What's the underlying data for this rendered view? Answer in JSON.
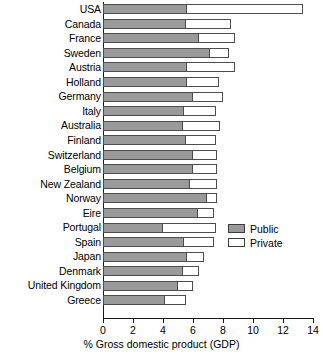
{
  "chart_data": {
    "type": "bar",
    "orientation": "horizontal",
    "stacked": true,
    "title": "",
    "xlabel": "% Gross domestic product (GDP)",
    "ylabel": "",
    "xlim": [
      0,
      14
    ],
    "xticks": [
      0,
      2,
      4,
      6,
      8,
      10,
      12,
      14
    ],
    "xtick_labels": [
      "0",
      "2",
      "4",
      "6",
      "8",
      "10",
      "12",
      "14"
    ],
    "grid": false,
    "legend_position": "right",
    "categories": [
      "USA",
      "Canada",
      "France",
      "Sweden",
      "Austria",
      "Holland",
      "Germany",
      "Italy",
      "Australia",
      "Finland",
      "Switzerland",
      "Belgium",
      "New Zealand",
      "Norway",
      "Eire",
      "Portugal",
      "Spain",
      "Japan",
      "Denmark",
      "United Kingdom",
      "Greece"
    ],
    "series": [
      {
        "name": "Public",
        "color": "#9a9a9a",
        "values": [
          5.6,
          5.5,
          6.4,
          7.1,
          5.6,
          5.6,
          6.0,
          5.4,
          5.3,
          5.5,
          6.0,
          6.0,
          5.8,
          6.9,
          6.3,
          4.0,
          5.4,
          5.6,
          5.3,
          5.0,
          4.1
        ]
      },
      {
        "name": "Private",
        "color": "#ffffff",
        "values": [
          7.7,
          3.0,
          2.4,
          1.3,
          3.2,
          2.1,
          2.0,
          2.1,
          2.5,
          2.0,
          1.6,
          1.6,
          1.8,
          0.7,
          1.1,
          3.5,
          2.0,
          1.1,
          1.1,
          1.0,
          1.4
        ]
      }
    ],
    "totals": [
      13.3,
      8.5,
      8.8,
      8.4,
      8.8,
      7.7,
      8.0,
      7.5,
      7.8,
      7.5,
      7.6,
      7.6,
      7.6,
      7.6,
      7.4,
      7.5,
      7.4,
      6.7,
      6.4,
      6.0,
      5.5
    ],
    "legend": [
      {
        "label": "Public",
        "swatch": "gray-filled"
      },
      {
        "label": "Private",
        "swatch": "white-filled"
      }
    ]
  },
  "colors": {
    "public": "#9a9a9a",
    "private": "#ffffff",
    "outline": "#4d4d4d",
    "axis": "#1a1a1a",
    "background": "#ffffff"
  }
}
